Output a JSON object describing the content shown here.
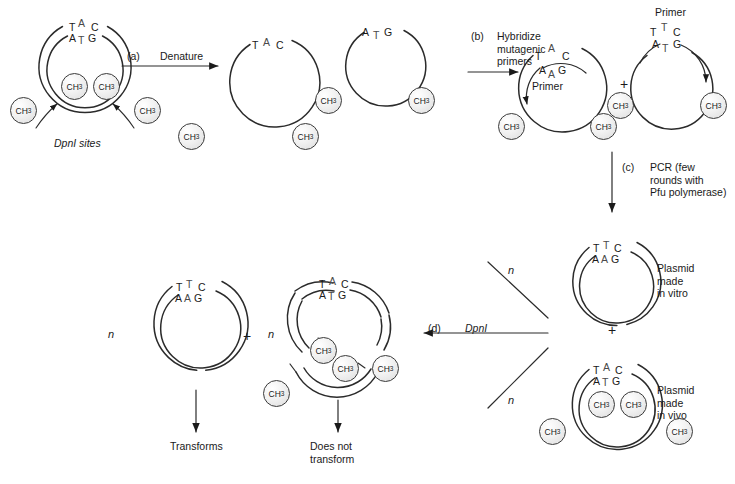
{
  "figure": {
    "steps": [
      {
        "id": "a",
        "tag": "(a)",
        "label": "Denature"
      },
      {
        "id": "b",
        "tag": "(b)",
        "label": "Hybridize\nmutagenic\nprimers"
      },
      {
        "id": "c",
        "tag": "(c)",
        "label": "PCR (few\nrounds with\nPfu polymerase)"
      },
      {
        "id": "d",
        "tag": "(d)",
        "label": "DpnI",
        "italic_part": "Dpn"
      }
    ],
    "annotations": {
      "dpn1_sites": "DpnI sites",
      "primer": "Primer",
      "plasmid_in_vitro": "Plasmid\nmade\nin vitro",
      "plasmid_in_vivo": "Plasmid\nmade\nin vivo",
      "transforms": "Transforms",
      "does_not_transform": "Does not\ntransform",
      "n_multiplier": "n",
      "plus": "+"
    },
    "methyl_label": "CH3",
    "methyl_label_display": "CH",
    "methyl_label_sub": "3"
  },
  "structures": {
    "parental_plasmid": {
      "name": "Parental methylated plasmid",
      "top_strand": [
        "T",
        "A",
        "C"
      ],
      "bottom_strand": [
        "A",
        "T",
        "G"
      ],
      "mutation_index": 1,
      "methyl_count": 4
    },
    "denatured_top": {
      "name": "Denatured single strand (top)",
      "strand": [
        "T",
        "A",
        "C"
      ],
      "mutation_index": 1,
      "methyl_count": 1
    },
    "denatured_bottom": {
      "name": "Denatured single strand (bottom)",
      "strand": [
        "A",
        "T",
        "G"
      ],
      "mutation_index": 1,
      "methyl_count": 2
    },
    "hybrid_left": {
      "name": "Template with annealed mutagenic primer (left)",
      "template_strand": [
        "T",
        "A",
        "C"
      ],
      "primer_strand": [
        "A",
        "A",
        "G"
      ],
      "mutation_index": 1,
      "primer_label": "Primer",
      "methyl_count": 2
    },
    "hybrid_right": {
      "name": "Template with annealed mutagenic primer (right)",
      "primer_strand": [
        "T",
        "T",
        "C"
      ],
      "template_strand": [
        "A",
        "T",
        "G"
      ],
      "mutation_index": 1,
      "primer_label": "Primer",
      "methyl_count": 2
    },
    "pcr_in_vitro": {
      "name": "Mutant plasmid made in vitro",
      "top_strand": [
        "T",
        "T",
        "C"
      ],
      "bottom_strand": [
        "A",
        "A",
        "G"
      ],
      "mutation_index": 1,
      "methyl_count": 0
    },
    "pcr_in_vivo": {
      "name": "Parental plasmid made in vivo",
      "top_strand": [
        "T",
        "A",
        "C"
      ],
      "bottom_strand": [
        "A",
        "T",
        "G"
      ],
      "mutation_index": 1,
      "methyl_count": 4
    },
    "product_mutant": {
      "name": "Intact mutant plasmid after DpnI",
      "top_strand": [
        "T",
        "T",
        "C"
      ],
      "bottom_strand": [
        "A",
        "A",
        "G"
      ],
      "mutation_index": 1,
      "methyl_count": 0,
      "fate": "Transforms"
    },
    "product_digested": {
      "name": "DpnI-digested parental plasmid fragments",
      "top_strand": [
        "T",
        "A",
        "C"
      ],
      "bottom_strand": [
        "A",
        "T",
        "G"
      ],
      "mutation_index": 1,
      "methyl_count": 4,
      "fate": "Does not transform"
    }
  },
  "colors": {
    "ink": "#1a1a1a",
    "stroke": "#2b2b2b",
    "methyl_fill": "#e8e8e8",
    "background": "#ffffff"
  }
}
